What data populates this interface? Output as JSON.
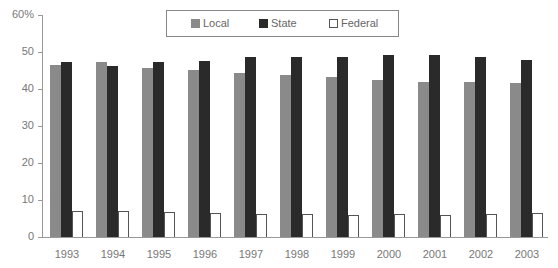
{
  "chart_data": {
    "type": "bar",
    "xlabel": "",
    "ylabel": "",
    "ylim": [
      0,
      60
    ],
    "yticks": [
      "0",
      "10",
      "20",
      "30",
      "40",
      "50",
      "60%"
    ],
    "categories": [
      "1993",
      "1994",
      "1995",
      "1996",
      "1997",
      "1998",
      "1999",
      "2000",
      "2001",
      "2002",
      "2003"
    ],
    "series": [
      {
        "name": "Local",
        "color": "#8a8a8a",
        "values": [
          46.6,
          47.2,
          45.6,
          45.1,
          44.2,
          43.7,
          43.2,
          42.4,
          42.0,
          42.0,
          41.7
        ]
      },
      {
        "name": "State",
        "color": "#2a2a2a",
        "values": [
          47.2,
          46.3,
          47.4,
          47.6,
          48.6,
          48.7,
          48.6,
          49.1,
          49.3,
          48.6,
          47.8
        ]
      },
      {
        "name": "Federal",
        "color": "#ffffff",
        "values": [
          7.0,
          6.9,
          6.7,
          6.4,
          6.1,
          6.1,
          5.9,
          6.1,
          5.9,
          6.1,
          6.6
        ]
      }
    ],
    "legend_position": "top-center",
    "grid": false
  },
  "legend": [
    {
      "label": "Local",
      "color": "#8a8a8a"
    },
    {
      "label": "State",
      "color": "#2a2a2a"
    },
    {
      "label": "Federal",
      "color": "#ffffff"
    }
  ]
}
